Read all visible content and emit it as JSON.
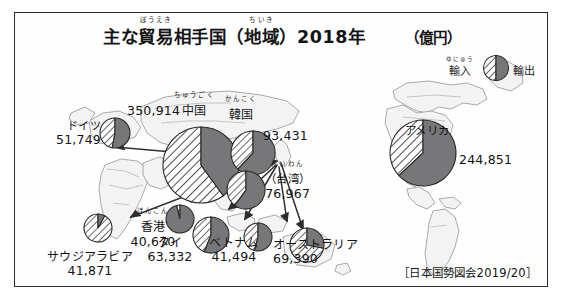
{
  "title": {
    "main_before": "主な",
    "ruby_boueki_rt": "ぼうえき",
    "ruby_boueki_rb": "貿易",
    "main_mid": "相手国（",
    "ruby_chiiki_rt": "ちいき",
    "ruby_chiiki_rb": "地域",
    "main_after": "）2018年",
    "unit": "（億円）"
  },
  "legend": {
    "import_label": "輸入",
    "import_ruby": "ゆにゅう",
    "export_label": "輸出",
    "import_pattern": "diagonal-hatch",
    "export_pattern": "solid-gray",
    "import_color": "#ffffff",
    "export_color": "#77777a"
  },
  "source": "［日本国勢図会2019/20］",
  "chart_data": {
    "type": "pie",
    "unit": "億円",
    "subtitle": "",
    "xlabel": "",
    "ylabel": "",
    "legend_position": "top-right",
    "grid": false,
    "series": [
      {
        "name": "輸入",
        "pattern": "diagonal-hatch"
      },
      {
        "name": "輸出",
        "pattern": "solid-gray"
      }
    ],
    "categories": [
      "ドイツ",
      "中国",
      "韓国",
      "（台湾）",
      "アメリカ",
      "香港",
      "タイ",
      "ベトナム",
      "オーストラリア",
      "サウジアラビア"
    ],
    "values": [
      51749,
      350914,
      93431,
      76967,
      244851,
      40670,
      63332,
      41494,
      69390,
      41871
    ],
    "points": [
      {
        "id": "germany",
        "name": "ドイツ",
        "ruby": "",
        "value": 51749,
        "value_text": "51,749",
        "import_share": 0.47,
        "export_share": 0.53,
        "pie": {
          "cx": 100,
          "cy": 120,
          "r": 15
        },
        "label": {
          "x": 22,
          "y": 108,
          "align": "right"
        }
      },
      {
        "id": "china",
        "name": "中国",
        "ruby": "ちゅうごく",
        "value": 350914,
        "value_text": "350,914",
        "import_share": 0.6,
        "export_share": 0.4,
        "pie": {
          "cx": 186,
          "cy": 152,
          "r": 38
        },
        "label": {
          "x": 130,
          "y": 92,
          "align": "left"
        }
      },
      {
        "id": "korea",
        "name": "韓国",
        "ruby": "かんこく",
        "value": 93431,
        "value_text": "93,431",
        "import_share": 0.38,
        "export_share": 0.62,
        "pie": {
          "cx": 238,
          "cy": 140,
          "r": 22
        },
        "label": {
          "x": 222,
          "y": 96,
          "align": "left"
        }
      },
      {
        "id": "taiwan",
        "name": "（台湾）",
        "ruby": "たいわん",
        "value": 76967,
        "value_text": "76,967",
        "import_share": 0.4,
        "export_share": 0.6,
        "pie": {
          "cx": 231,
          "cy": 177,
          "r": 19
        },
        "label": {
          "x": 258,
          "y": 158,
          "align": "left"
        }
      },
      {
        "id": "usa",
        "name": "アメリカ",
        "ruby": "",
        "value": 244851,
        "value_text": "244,851",
        "import_share": 0.37,
        "export_share": 0.63,
        "pie": {
          "cx": 408,
          "cy": 140,
          "r": 33
        },
        "label": {
          "x": 404,
          "y": 116,
          "align": "left"
        }
      },
      {
        "id": "hongkong",
        "name": "香港",
        "ruby": "ほんこん",
        "value": 40670,
        "value_text": "40,670",
        "import_share": 0.04,
        "export_share": 0.96,
        "pie": {
          "cx": 165,
          "cy": 206,
          "r": 14
        },
        "label": {
          "x": 132,
          "y": 210,
          "align": "left"
        }
      },
      {
        "id": "thailand",
        "name": "タイ",
        "ruby": "",
        "value": 63332,
        "value_text": "63,332",
        "import_share": 0.44,
        "export_share": 0.56,
        "pie": {
          "cx": 196,
          "cy": 222,
          "r": 18
        },
        "label": {
          "x": 148,
          "y": 237,
          "align": "left"
        }
      },
      {
        "id": "vietnam",
        "name": "ベトナム",
        "ruby": "",
        "value": 41494,
        "value_text": "41,494",
        "import_share": 0.46,
        "export_share": 0.54,
        "pie": {
          "cx": 243,
          "cy": 224,
          "r": 14
        },
        "label": {
          "x": 200,
          "y": 237,
          "align": "left"
        }
      },
      {
        "id": "australia",
        "name": "オーストラリア",
        "ruby": "",
        "value": 69390,
        "value_text": "69,390",
        "import_share": 0.72,
        "export_share": 0.28,
        "pie": {
          "cx": 292,
          "cy": 232,
          "r": 17
        },
        "label": {
          "x": 278,
          "y": 236,
          "align": "left"
        }
      },
      {
        "id": "saudi",
        "name": "サウジアラビア",
        "ruby": "",
        "value": 41871,
        "value_text": "41,871",
        "import_share": 0.92,
        "export_share": 0.08,
        "pie": {
          "cx": 83,
          "cy": 215,
          "r": 14
        },
        "label": {
          "x": 44,
          "y": 246,
          "align": "left"
        }
      }
    ]
  }
}
